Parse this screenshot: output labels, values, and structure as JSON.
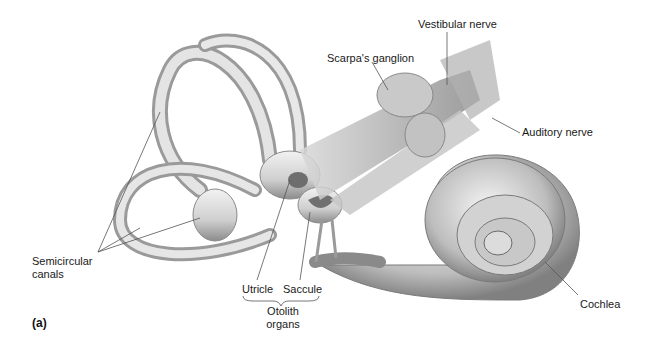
{
  "figure": {
    "panel_label": "(a)",
    "labels": {
      "vestibular_nerve": "Vestibular nerve",
      "scarpas_ganglion": "Scarpa's ganglion",
      "auditory_nerve": "Auditory nerve",
      "semicircular_canals_line1": "Semicircular",
      "semicircular_canals_line2": "canals",
      "utricle": "Utricle",
      "saccule": "Saccule",
      "otolith_line1": "Otolith",
      "otolith_line2": "organs",
      "cochlea": "Cochlea"
    },
    "colors": {
      "tissue_light": "#e6e6e6",
      "tissue_mid": "#bdbdbd",
      "tissue_dark": "#7a7a7a",
      "leader_line": "#555555"
    }
  }
}
